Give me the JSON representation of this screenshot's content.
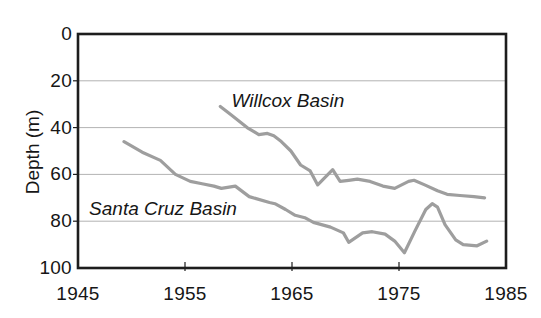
{
  "figure": {
    "background": "#ffffff",
    "colors": {
      "line": "#9e9e9e",
      "grid": "#b3b3b3",
      "axis": "#1d1d1d",
      "text": "#161616"
    }
  },
  "chart_data": {
    "type": "line",
    "title": "",
    "xlabel": "",
    "ylabel": "Depth (m)",
    "x_ticks": [
      "1945",
      "1955",
      "1965",
      "1975",
      "1985"
    ],
    "x_tick_values": [
      1945,
      1955,
      1965,
      1975,
      1985
    ],
    "y_ticks": [
      "0",
      "20",
      "40",
      "60",
      "80",
      "100"
    ],
    "y_tick_values": [
      0,
      20,
      40,
      60,
      80,
      100
    ],
    "xlim": [
      1945,
      1985
    ],
    "ylim": [
      0,
      100
    ],
    "y_axis_inverted_note": "depth in meters increases downward",
    "grid": "horizontal gridlines at 20, 40, 60, 80",
    "legend": "inline italic labels beside each line",
    "series": [
      {
        "name": "Willcox Basin",
        "points": [
          [
            1958.3,
            31
          ],
          [
            1959.3,
            34.5
          ],
          [
            1960.8,
            40
          ],
          [
            1961.9,
            43
          ],
          [
            1962.7,
            42.5
          ],
          [
            1963.3,
            43.5
          ],
          [
            1964.0,
            46
          ],
          [
            1964.9,
            50
          ],
          [
            1965.8,
            56
          ],
          [
            1966.7,
            58.5
          ],
          [
            1967.4,
            64.5
          ],
          [
            1968.8,
            58
          ],
          [
            1969.5,
            63
          ],
          [
            1970.3,
            62.5
          ],
          [
            1971.1,
            62
          ],
          [
            1972.3,
            63
          ],
          [
            1973.5,
            65
          ],
          [
            1974.6,
            66
          ],
          [
            1975.9,
            63
          ],
          [
            1976.4,
            62.5
          ],
          [
            1977.4,
            64.5
          ],
          [
            1978.6,
            67
          ],
          [
            1979.5,
            68.5
          ],
          [
            1980.7,
            69
          ],
          [
            1982.0,
            69.5
          ],
          [
            1983.0,
            70
          ]
        ]
      },
      {
        "name": "Santa Cruz Basin",
        "points": [
          [
            1949.3,
            46
          ],
          [
            1951.0,
            50.5
          ],
          [
            1952.7,
            54
          ],
          [
            1954.1,
            60
          ],
          [
            1955.5,
            63
          ],
          [
            1956.6,
            64
          ],
          [
            1957.7,
            65
          ],
          [
            1958.4,
            66
          ],
          [
            1959.7,
            65
          ],
          [
            1961.0,
            69.5
          ],
          [
            1962.9,
            72
          ],
          [
            1963.4,
            72.5
          ],
          [
            1964.4,
            75
          ],
          [
            1965.3,
            77.5
          ],
          [
            1966.2,
            78.5
          ],
          [
            1967.0,
            80.5
          ],
          [
            1968.6,
            82.5
          ],
          [
            1969.8,
            85
          ],
          [
            1970.3,
            89
          ],
          [
            1971.6,
            85
          ],
          [
            1972.5,
            84.5
          ],
          [
            1973.7,
            85.5
          ],
          [
            1974.6,
            88.5
          ],
          [
            1975.5,
            93.5
          ],
          [
            1976.5,
            84
          ],
          [
            1977.5,
            75
          ],
          [
            1978.1,
            72.5
          ],
          [
            1978.6,
            74
          ],
          [
            1979.3,
            81.5
          ],
          [
            1980.3,
            88
          ],
          [
            1981.0,
            90
          ],
          [
            1982.3,
            90.5
          ],
          [
            1983.2,
            88.5
          ]
        ]
      }
    ]
  }
}
